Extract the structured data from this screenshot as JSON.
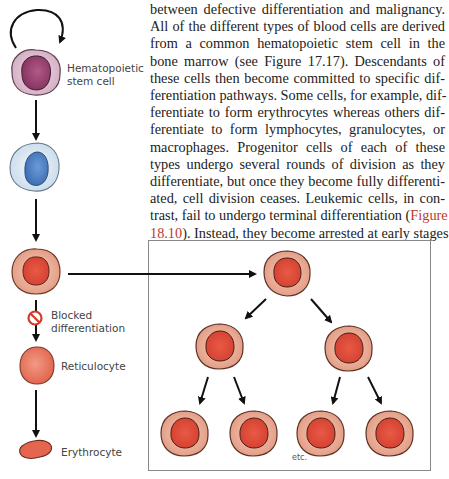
{
  "text": {
    "lines": [
      "between defective differentiation and malignancy.",
      "All of the different types of blood cells are derived",
      "from a common hematopoietic stem cell in the",
      "bone marrow (see Figure 17.17). Descendants of",
      "these cells then become committed to specific dif-",
      "ferentiation pathways. Some cells, for example, dif-",
      "ferentiate to form erythrocytes whereas others dif-",
      "ferentiate to form lymphocytes, granulocytes, or",
      "macrophages. Progenitor cells of each of these",
      "types undergo several rounds of division as they",
      "differentiate, but once they become fully differenti-",
      "ated, cell division ceases. Leukemic cells, in con-"
    ],
    "line13_pre": "trast, fail to undergo terminal differentiation (",
    "line13_ref": "Figure",
    "line14_ref": "18.10",
    "line14_post": "). Instead, they become arrested at early stages"
  },
  "figure": {
    "labels": {
      "stem_cell_1": "Hematopoietic",
      "stem_cell_2": "stem cell",
      "blocked_1": "Blocked",
      "blocked_2": "differentiation",
      "reticulocyte": "Reticulocyte",
      "erythrocyte": "Erythrocyte",
      "etc": "etc."
    },
    "colors": {
      "stem_cell": "#d9b8cc",
      "stem_nucleus": "#9a3f6e",
      "progenitor": "#dfe9f3",
      "progenitor_nucleus": "#4f82c4",
      "leukemic": "#e9a58e",
      "leukemic_nucleus": "#d9483a",
      "blocked_icon": "#d63a2a",
      "reference_link": "#c0392b"
    }
  }
}
